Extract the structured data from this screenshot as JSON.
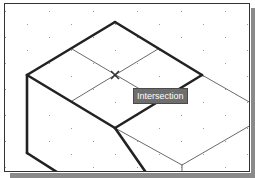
{
  "viewport": {
    "grid": {
      "type": "isometric",
      "dot_color": "#9a9a9a",
      "x_step": 22,
      "y_step": 13
    },
    "colors": {
      "thick_line": "#222222",
      "thin_line": "#6a6a6a",
      "marker": "#333333"
    },
    "thick_edges": [
      [
        27,
        75,
        115,
        22
      ],
      [
        115,
        22,
        202,
        75
      ],
      [
        202,
        75,
        115,
        128
      ],
      [
        27,
        75,
        115,
        128
      ],
      [
        27,
        75,
        27,
        153
      ],
      [
        27,
        153,
        60,
        174
      ],
      [
        115,
        128,
        147,
        174
      ]
    ],
    "thin_edges": [
      [
        72,
        49,
        160,
        101
      ],
      [
        158,
        49,
        72,
        101
      ],
      [
        202,
        75,
        251,
        103
      ],
      [
        115,
        128,
        182,
        165
      ],
      [
        182,
        165,
        251,
        125
      ],
      [
        182,
        165,
        182,
        174
      ]
    ],
    "snap_marker": {
      "x": 115,
      "y": 75,
      "type": "intersection"
    }
  },
  "tooltip": {
    "label": "Intersection",
    "x": 133,
    "y": 88
  }
}
